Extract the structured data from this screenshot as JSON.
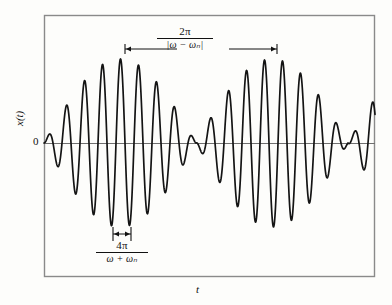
{
  "figure": {
    "type": "beats-waveform-plot",
    "background_color": "#fdfdfb",
    "frame_color": "#8a8a8a",
    "curve_color": "#141414",
    "axis_color": "#6f6f6f",
    "annotation_color": "#111111"
  },
  "axes": {
    "y_label": "x(t)",
    "x_label": "t",
    "origin_tick_label": "0",
    "frame": {
      "left": 44,
      "top": 15,
      "right": 375,
      "bottom": 277
    },
    "zero_line_y": 143
  },
  "annotations": {
    "beat_period": {
      "numerator": "2π",
      "denominator": "|ω − ωₙ|",
      "arrow_from_x": 125,
      "arrow_to_x": 277,
      "arrow_y": 49
    },
    "carrier_period": {
      "numerator": "4π",
      "denominator": "ω + ωₙ",
      "arrow_from_x": 113,
      "arrow_to_x": 131,
      "arrow_y": 234
    }
  },
  "chart_data": {
    "type": "line",
    "title": "",
    "xlabel": "t",
    "ylabel": "x(t)",
    "grid": false,
    "legend": null,
    "equation": "x(t) = A sin((ω − ωₙ)t/2) · sin((ω + ωₙ)t/2)",
    "xlim": [
      0,
      1
    ],
    "ylim": [
      -1.08,
      1.08
    ],
    "beat_period_px": 152,
    "carrier_period_px": 18,
    "envelope_nodes_px": [
      44,
      190,
      340
    ],
    "amplitude_px": 84,
    "series": [
      {
        "name": "x(t)",
        "carrier_cycles_per_beat": 8.44,
        "envelope": "abs(sin(pi*(x-44)/152))",
        "carrier": "sin(2*pi*(x-44)/18)"
      }
    ]
  }
}
